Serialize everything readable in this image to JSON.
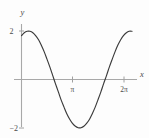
{
  "figure": {
    "name": "trigonometric-function-plot",
    "background_color": "#fdfdfd",
    "curve_color": "#3b3b3b",
    "axis_color": "#a8a8a8",
    "label_color": "#4a4a4a"
  },
  "axes": {
    "x_axis_label": "x",
    "y_axis_label": "y",
    "x_ticks": [
      {
        "label": "π",
        "value": 3.14159
      },
      {
        "label": "2π",
        "value": 6.28319
      }
    ],
    "y_ticks": [
      {
        "label": "2",
        "value": 2
      },
      {
        "label": "−2",
        "value": -2
      }
    ]
  },
  "chart_data": {
    "type": "line",
    "title": "",
    "subtitle": "",
    "xlabel": "x",
    "ylabel": "y",
    "xlim": [
      0,
      6.98
    ],
    "ylim": [
      -2.45,
      2.45
    ],
    "grid": false,
    "legend": null,
    "x_tick_labels": [
      "π",
      "2π"
    ],
    "x_tick_values": [
      3.14159,
      6.28319
    ],
    "y_tick_labels": [
      "2",
      "−2"
    ],
    "y_tick_values": [
      2,
      -2
    ],
    "annotations": [],
    "series": [
      {
        "name": "y = 2cos(x − 0.45)",
        "color": "#3b3b3b",
        "x": [
          0.0,
          0.17,
          0.35,
          0.52,
          0.7,
          0.87,
          1.05,
          1.22,
          1.4,
          1.57,
          1.75,
          1.92,
          2.09,
          2.27,
          2.44,
          2.62,
          2.79,
          2.97,
          3.14,
          3.32,
          3.49,
          3.67,
          3.84,
          4.01,
          4.19,
          4.36,
          4.54,
          4.71,
          4.89,
          5.06,
          5.24,
          5.41,
          5.59,
          5.76,
          5.93,
          6.11,
          6.28,
          6.46,
          6.63,
          6.81
        ],
        "y": [
          1.81,
          1.93,
          1.99,
          1.99,
          1.93,
          1.81,
          1.64,
          1.41,
          1.14,
          0.84,
          0.51,
          0.17,
          -0.17,
          -0.51,
          -0.84,
          -1.14,
          -1.41,
          -1.64,
          -1.81,
          -1.93,
          -1.99,
          -1.99,
          -1.93,
          -1.81,
          -1.64,
          -1.41,
          -1.14,
          -0.84,
          -0.51,
          -0.17,
          0.17,
          0.51,
          0.84,
          1.14,
          1.41,
          1.64,
          1.81,
          1.93,
          1.99,
          1.99
        ],
        "markers": false,
        "key_points": {
          "y_intercept": 1.81,
          "maximum": {
            "x": 0.45,
            "y": 2.0
          },
          "first_zero": {
            "x": 2.02,
            "y": 0
          },
          "minimum": {
            "x": 3.59,
            "y": -2.0
          },
          "second_zero": {
            "x": 5.16,
            "y": 0
          },
          "right_end": {
            "x": 6.81,
            "y": 1.99
          }
        }
      }
    ]
  }
}
